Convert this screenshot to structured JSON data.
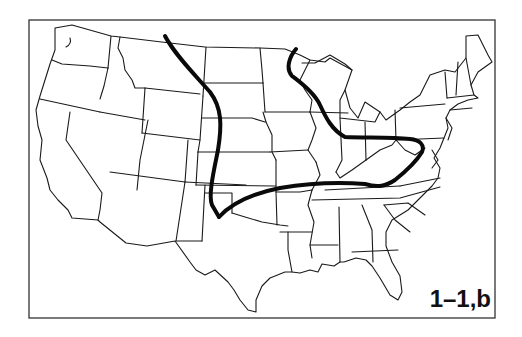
{
  "figure": {
    "label": "1–1,b",
    "colors": {
      "background": "#ffffff",
      "boundary_line": "#1a1a1a",
      "highlight_line": "#0a0a0a"
    },
    "overlays": [
      {
        "name": "western-boundary-curve",
        "description": "thick line running from northern Montana/North Dakota border south through the Dakotas, Nebraska, Kansas to the Texas panhandle"
      },
      {
        "name": "eastern-boundary-curve",
        "description": "thick line from northern Minnesota through Wisconsin, Illinois, Indiana, Ohio, looping through West Virginia/Virginia, then west along Kentucky-Tennessee line to Oklahoma"
      }
    ]
  }
}
